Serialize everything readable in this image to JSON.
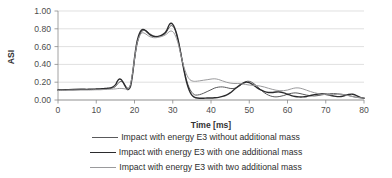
{
  "chart_data": {
    "type": "line",
    "title": "",
    "xlabel": "Time [ms]",
    "ylabel": "ASI",
    "xlim": [
      0,
      80
    ],
    "ylim": [
      0,
      1.0
    ],
    "xticks": [
      0,
      10,
      20,
      30,
      40,
      50,
      60,
      70,
      80
    ],
    "xtick_labels": [
      "0",
      "10",
      "20",
      "30",
      "40",
      "50",
      "60",
      "70",
      "80"
    ],
    "yticks": [
      0.0,
      0.2,
      0.4,
      0.6,
      0.8,
      1.0
    ],
    "ytick_labels": [
      "0.00",
      "0.20",
      "0.40",
      "0.60",
      "0.80",
      "1.00"
    ],
    "grid": "horizontal",
    "legend_position": "bottom",
    "series": [
      {
        "name": "Impact with energy E3 without additional mass",
        "color": "#59595b",
        "width": 1.0,
        "x": [
          0,
          2,
          4,
          6,
          8,
          10,
          11,
          12,
          13,
          14,
          15,
          15.5,
          16,
          16.5,
          17,
          17.5,
          18,
          18.5,
          19,
          19.5,
          20,
          20.5,
          21,
          21.5,
          22,
          22.5,
          23,
          23.5,
          24,
          25,
          26,
          27,
          28,
          28.5,
          29,
          29.5,
          30,
          30.5,
          31,
          31.5,
          32,
          32.5,
          33,
          33.5,
          34,
          34.5,
          35,
          35.5,
          36,
          37,
          38,
          39,
          40,
          41,
          42,
          43,
          44,
          45,
          46,
          47,
          48,
          49,
          50,
          51,
          52,
          53,
          54,
          55,
          56,
          57,
          58,
          59,
          60,
          61,
          62,
          63,
          64,
          65,
          66,
          67,
          68,
          69,
          70,
          71,
          72,
          73,
          74,
          75,
          76,
          77,
          78,
          79,
          80
        ],
        "y": [
          0.11,
          0.115,
          0.115,
          0.118,
          0.118,
          0.12,
          0.122,
          0.125,
          0.128,
          0.132,
          0.15,
          0.175,
          0.2,
          0.21,
          0.2,
          0.17,
          0.14,
          0.135,
          0.18,
          0.3,
          0.45,
          0.59,
          0.68,
          0.74,
          0.775,
          0.785,
          0.78,
          0.765,
          0.745,
          0.72,
          0.715,
          0.72,
          0.745,
          0.775,
          0.81,
          0.835,
          0.83,
          0.8,
          0.74,
          0.65,
          0.55,
          0.44,
          0.33,
          0.24,
          0.17,
          0.12,
          0.085,
          0.065,
          0.055,
          0.06,
          0.075,
          0.095,
          0.115,
          0.135,
          0.145,
          0.147,
          0.14,
          0.13,
          0.13,
          0.145,
          0.175,
          0.205,
          0.21,
          0.19,
          0.155,
          0.115,
          0.08,
          0.055,
          0.04,
          0.035,
          0.04,
          0.05,
          0.065,
          0.075,
          0.08,
          0.075,
          0.065,
          0.055,
          0.048,
          0.045,
          0.05,
          0.058,
          0.065,
          0.07,
          0.072,
          0.07,
          0.065,
          0.06,
          0.05,
          0.04,
          0.03,
          0.025,
          0.022
        ]
      },
      {
        "name": "Impact with energy E3 with one additional mass",
        "color": "#2b2b2d",
        "width": 1.4,
        "x": [
          0,
          2,
          4,
          6,
          8,
          10,
          11,
          12,
          13,
          14,
          15,
          15.5,
          16,
          16.5,
          17,
          17.5,
          18,
          18.5,
          19,
          19.5,
          20,
          20.5,
          21,
          21.5,
          22,
          22.5,
          23,
          23.5,
          24,
          25,
          26,
          27,
          28,
          28.5,
          29,
          29.5,
          30,
          30.5,
          31,
          31.5,
          32,
          32.5,
          33,
          33.5,
          34,
          34.5,
          35,
          35.5,
          36,
          37,
          38,
          39,
          40,
          41,
          42,
          43,
          44,
          45,
          46,
          47,
          48,
          49,
          50,
          51,
          52,
          53,
          54,
          55,
          56,
          57,
          58,
          59,
          60,
          61,
          62,
          63,
          64,
          65,
          66,
          67,
          68,
          69,
          70,
          71,
          72,
          73,
          74,
          75,
          76,
          77,
          78,
          79,
          80
        ],
        "y": [
          0.112,
          0.115,
          0.118,
          0.12,
          0.12,
          0.123,
          0.125,
          0.128,
          0.132,
          0.14,
          0.17,
          0.21,
          0.235,
          0.23,
          0.2,
          0.16,
          0.125,
          0.12,
          0.16,
          0.29,
          0.47,
          0.62,
          0.71,
          0.765,
          0.79,
          0.79,
          0.775,
          0.755,
          0.735,
          0.715,
          0.712,
          0.725,
          0.755,
          0.79,
          0.84,
          0.862,
          0.85,
          0.81,
          0.745,
          0.655,
          0.545,
          0.43,
          0.32,
          0.22,
          0.145,
          0.09,
          0.055,
          0.035,
          0.025,
          0.02,
          0.02,
          0.022,
          0.022,
          0.025,
          0.03,
          0.04,
          0.055,
          0.08,
          0.115,
          0.15,
          0.18,
          0.2,
          0.195,
          0.17,
          0.14,
          0.115,
          0.095,
          0.085,
          0.085,
          0.09,
          0.09,
          0.08,
          0.065,
          0.05,
          0.04,
          0.035,
          0.035,
          0.04,
          0.05,
          0.06,
          0.068,
          0.07,
          0.065,
          0.055,
          0.045,
          0.038,
          0.04,
          0.05,
          0.062,
          0.065,
          0.05,
          0.03,
          0.02
        ]
      },
      {
        "name": "Impact with energy E3 with two additional mass",
        "color": "#9a9a9c",
        "width": 1.0,
        "x": [
          0,
          2,
          4,
          6,
          8,
          10,
          11,
          12,
          13,
          14,
          15,
          15.5,
          16,
          16.5,
          17,
          17.5,
          18,
          18.5,
          19,
          19.5,
          20,
          20.5,
          21,
          21.5,
          22,
          22.5,
          23,
          23.5,
          24,
          25,
          26,
          27,
          28,
          28.5,
          29,
          29.5,
          30,
          30.5,
          31,
          31.5,
          32,
          32.5,
          33,
          33.5,
          34,
          34.5,
          35,
          35.5,
          36,
          37,
          38,
          39,
          40,
          41,
          42,
          43,
          44,
          45,
          46,
          47,
          48,
          49,
          50,
          51,
          52,
          53,
          54,
          55,
          56,
          57,
          58,
          59,
          60,
          61,
          62,
          63,
          64,
          65,
          66,
          67,
          68,
          69,
          70,
          71,
          72,
          73,
          74,
          75,
          76,
          77,
          78,
          79,
          80
        ],
        "y": [
          0.108,
          0.11,
          0.112,
          0.112,
          0.112,
          0.115,
          0.115,
          0.118,
          0.12,
          0.122,
          0.125,
          0.128,
          0.13,
          0.13,
          0.128,
          0.125,
          0.122,
          0.13,
          0.185,
          0.31,
          0.46,
          0.6,
          0.685,
          0.735,
          0.755,
          0.752,
          0.74,
          0.725,
          0.712,
          0.7,
          0.702,
          0.712,
          0.73,
          0.745,
          0.765,
          0.775,
          0.768,
          0.74,
          0.69,
          0.62,
          0.53,
          0.44,
          0.36,
          0.3,
          0.255,
          0.228,
          0.215,
          0.21,
          0.21,
          0.215,
          0.222,
          0.228,
          0.235,
          0.238,
          0.23,
          0.215,
          0.2,
          0.19,
          0.185,
          0.185,
          0.182,
          0.175,
          0.168,
          0.165,
          0.162,
          0.155,
          0.145,
          0.132,
          0.12,
          0.11,
          0.105,
          0.105,
          0.112,
          0.125,
          0.135,
          0.135,
          0.125,
          0.11,
          0.095,
          0.082,
          0.072,
          0.065,
          0.06,
          0.058,
          0.06,
          0.065,
          0.065,
          0.058,
          0.048,
          0.038,
          0.03,
          0.025,
          0.022
        ]
      }
    ]
  },
  "legend": {
    "items": [
      {
        "label": "Impact with energy E3 without additional mass",
        "color": "#59595b",
        "width": 1.0
      },
      {
        "label": "Impact with energy E3 with one additional mass",
        "color": "#2b2b2d",
        "width": 1.6
      },
      {
        "label": "Impact with energy E3 with two additional mass",
        "color": "#9a9a9c",
        "width": 1.0
      }
    ]
  },
  "axes": {
    "x_title": "Time [ms]",
    "y_title": "ASI"
  },
  "colors": {
    "gridline": "#d2d2d2",
    "axis": "#8a8a8a",
    "text": "#4d4d4d",
    "background": "#ffffff"
  }
}
